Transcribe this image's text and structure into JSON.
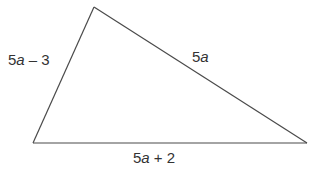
{
  "diagram": {
    "type": "triangle",
    "vertices": {
      "top": {
        "x": 94,
        "y": 7
      },
      "bottom_left": {
        "x": 33,
        "y": 143
      },
      "bottom_right": {
        "x": 307,
        "y": 143
      }
    },
    "line_color": "#4a4a4a",
    "sides": {
      "left": {
        "coef": "5",
        "var": "a",
        "rest": " – 3",
        "full": "5a – 3"
      },
      "right": {
        "coef": "5",
        "var": "a",
        "rest": "",
        "full": "5a"
      },
      "bottom": {
        "coef": "5",
        "var": "a",
        "rest": " + 2",
        "full": "5a + 2"
      }
    }
  }
}
